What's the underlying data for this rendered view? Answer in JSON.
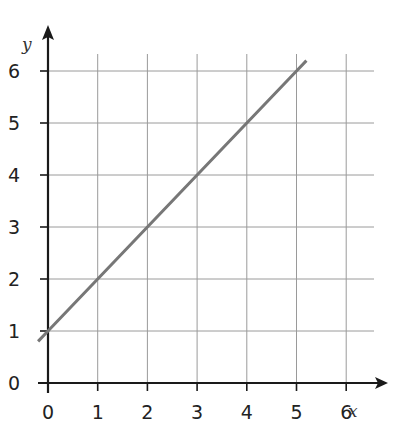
{
  "chart_data": {
    "type": "line",
    "title": "",
    "xlabel": "x",
    "ylabel": "y",
    "xlim": [
      0,
      6
    ],
    "ylim": [
      0,
      6
    ],
    "x_ticks": [
      "0",
      "1",
      "2",
      "3",
      "4",
      "5",
      "6"
    ],
    "y_ticks": [
      "0",
      "1",
      "2",
      "3",
      "4",
      "5",
      "6"
    ],
    "grid": true,
    "legend": null,
    "series": [
      {
        "name": "y = x + 1",
        "x": [
          -0.2,
          0,
          1,
          2,
          3,
          4,
          5,
          5.2
        ],
        "y": [
          0.8,
          1,
          2,
          3,
          4,
          5,
          6,
          6.2
        ]
      }
    ],
    "colors": {
      "line": "#777777",
      "grid": "#9a9a9a",
      "axis": "#1a1a1a"
    }
  }
}
